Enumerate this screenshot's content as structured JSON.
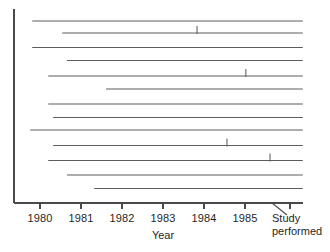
{
  "chart_data": {
    "type": "bar",
    "orientation": "horizontal",
    "title": "",
    "subtitle": "",
    "xlabel": "Year",
    "ylabel": "",
    "xlim": [
      1979.4,
      1986.3
    ],
    "grid": false,
    "legend": null,
    "xticks": [
      {
        "value": 1980,
        "label": "1980",
        "px": 40
      },
      {
        "value": 1981,
        "label": "1981",
        "px": 81
      },
      {
        "value": 1982,
        "label": "1982",
        "px": 122
      },
      {
        "value": 1983,
        "label": "1983",
        "px": 163
      },
      {
        "value": 1984,
        "label": "1984",
        "px": 204
      },
      {
        "value": 1985,
        "label": "1985",
        "px": 245
      },
      {
        "value": 1986.1,
        "label": "",
        "px": 290
      }
    ],
    "annotations": [
      {
        "name": "study-performed",
        "line1": "Study",
        "line2": "performed"
      }
    ],
    "bars": [
      {
        "index": 1,
        "start": 1979.81,
        "end": 1986.41,
        "cap_at": null,
        "y_px": 21.0
      },
      {
        "index": 2,
        "start": 1980.54,
        "end": 1986.41,
        "cap_at": 1983.83,
        "y_px": 33.0
      },
      {
        "index": 3,
        "start": 1979.81,
        "end": 1986.41,
        "cap_at": null,
        "y_px": 47.5
      },
      {
        "index": 4,
        "start": 1980.66,
        "end": 1986.41,
        "cap_at": null,
        "y_px": 60.5
      },
      {
        "index": 5,
        "start": 1980.2,
        "end": 1986.41,
        "cap_at": 1985.02,
        "y_px": 76.0
      },
      {
        "index": 6,
        "start": 1981.61,
        "end": 1986.41,
        "cap_at": null,
        "y_px": 89.0
      },
      {
        "index": 7,
        "start": 1980.2,
        "end": 1986.41,
        "cap_at": null,
        "y_px": 104.0
      },
      {
        "index": 8,
        "start": 1980.32,
        "end": 1986.41,
        "cap_at": null,
        "y_px": 117.5
      },
      {
        "index": 9,
        "start": 1979.76,
        "end": 1986.41,
        "cap_at": null,
        "y_px": 130.0
      },
      {
        "index": 10,
        "start": 1980.32,
        "end": 1986.41,
        "cap_at": 1984.56,
        "y_px": 145.5
      },
      {
        "index": 11,
        "start": 1980.2,
        "end": 1986.41,
        "cap_at": 1985.61,
        "y_px": 160.5
      },
      {
        "index": 12,
        "start": 1980.66,
        "end": 1986.41,
        "cap_at": null,
        "y_px": 175.0
      },
      {
        "index": 13,
        "start": 1981.32,
        "end": 1986.41,
        "cap_at": null,
        "y_px": 188.5
      }
    ]
  },
  "axes": {
    "y_axis": {
      "x_px": 14,
      "top_px": 9,
      "bottom_px": 203
    },
    "x_axis": {
      "y_px": 203,
      "left_px": 14,
      "right_px": 303
    },
    "tick_length_px": 6
  },
  "colors": {
    "background": "#ffffff",
    "axis": "#4a4a4a",
    "bar": "#5d5d5d",
    "text": "#1f1f1f"
  }
}
